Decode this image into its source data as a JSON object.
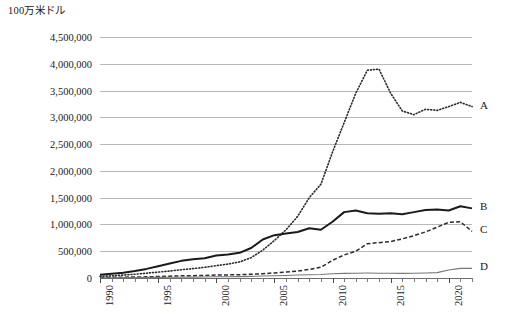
{
  "chart_data": {
    "type": "line",
    "title": "",
    "ylabel": "100万米ドル",
    "xlabel": "",
    "ylim": [
      0,
      4500000
    ],
    "ytick_labels": [
      "4,500,000",
      "4,000,000",
      "3,500,000",
      "3,000,000",
      "2,500,000",
      "2,000,000",
      "1,500,000",
      "1,000,000",
      "500,000",
      "0"
    ],
    "ytick_values": [
      4500000,
      4000000,
      3500000,
      3000000,
      2500000,
      2000000,
      1500000,
      1000000,
      500000,
      0
    ],
    "xlim": [
      1990,
      2022
    ],
    "xtick_labels": [
      "1990",
      "1995",
      "2000",
      "2005",
      "2010",
      "2015",
      "2020"
    ],
    "xtick_values": [
      1990,
      1995,
      2000,
      2005,
      2010,
      2015,
      2020
    ],
    "grid": "horizontal",
    "legend_position": "right-inline",
    "x": [
      1990,
      1991,
      1992,
      1993,
      1994,
      1995,
      1996,
      1997,
      1998,
      1999,
      2000,
      2001,
      2002,
      2003,
      2004,
      2005,
      2006,
      2007,
      2008,
      2009,
      2010,
      2011,
      2012,
      2013,
      2014,
      2015,
      2016,
      2017,
      2018,
      2019,
      2020,
      2021,
      2022
    ],
    "series": [
      {
        "name": "A",
        "label": "A",
        "style": "dotted",
        "color": "#2b2b2b",
        "values": [
          30000,
          40000,
          55000,
          70000,
          90000,
          110000,
          130000,
          155000,
          175000,
          200000,
          230000,
          260000,
          300000,
          380000,
          520000,
          700000,
          900000,
          1150000,
          1500000,
          1750000,
          2350000,
          2900000,
          3450000,
          3880000,
          3900000,
          3450000,
          3120000,
          3050000,
          3150000,
          3130000,
          3200000,
          3280000,
          3200000
        ]
      },
      {
        "name": "B",
        "label": "B",
        "style": "solid-thick",
        "color": "#1a1a1a",
        "values": [
          60000,
          80000,
          100000,
          130000,
          170000,
          220000,
          270000,
          320000,
          350000,
          370000,
          420000,
          440000,
          470000,
          560000,
          720000,
          800000,
          830000,
          860000,
          930000,
          900000,
          1050000,
          1230000,
          1260000,
          1210000,
          1200000,
          1210000,
          1190000,
          1230000,
          1270000,
          1280000,
          1260000,
          1340000,
          1300000
        ]
      },
      {
        "name": "C",
        "label": "C",
        "style": "dashed",
        "color": "#2b2b2b",
        "values": [
          10000,
          12000,
          15000,
          18000,
          22000,
          28000,
          34000,
          40000,
          44000,
          48000,
          55000,
          58000,
          62000,
          70000,
          80000,
          95000,
          110000,
          130000,
          160000,
          200000,
          330000,
          430000,
          500000,
          640000,
          660000,
          680000,
          730000,
          790000,
          860000,
          950000,
          1040000,
          1050000,
          870000
        ]
      },
      {
        "name": "D",
        "label": "D",
        "style": "solid-thin",
        "color": "#777777",
        "values": [
          5000,
          6000,
          7000,
          8000,
          9000,
          11000,
          13000,
          15000,
          17000,
          19000,
          22000,
          24000,
          26000,
          30000,
          36000,
          42000,
          48000,
          55000,
          62000,
          66000,
          78000,
          86000,
          90000,
          92000,
          90000,
          88000,
          86000,
          88000,
          92000,
          100000,
          150000,
          180000,
          180000
        ]
      }
    ]
  }
}
